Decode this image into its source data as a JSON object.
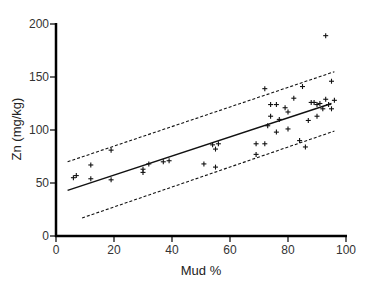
{
  "chart_data": {
    "type": "scatter",
    "title": "",
    "xlabel": "Mud %",
    "ylabel": "Zn (mg/kg)",
    "xlim": [
      0,
      100
    ],
    "ylim": [
      0,
      200
    ],
    "xticks": [
      0,
      20,
      40,
      60,
      80,
      100
    ],
    "yticks": [
      0,
      50,
      100,
      150,
      200
    ],
    "grid": false,
    "legend": null,
    "marker": "+",
    "colors": {
      "points": "#111111",
      "axis": "#000000",
      "lines": "#111111"
    },
    "points": [
      {
        "x": 6,
        "y": 55
      },
      {
        "x": 7,
        "y": 57
      },
      {
        "x": 12,
        "y": 67
      },
      {
        "x": 12,
        "y": 54
      },
      {
        "x": 19,
        "y": 81
      },
      {
        "x": 19,
        "y": 53
      },
      {
        "x": 30,
        "y": 63
      },
      {
        "x": 30,
        "y": 60
      },
      {
        "x": 32,
        "y": 68
      },
      {
        "x": 37,
        "y": 70
      },
      {
        "x": 39,
        "y": 71
      },
      {
        "x": 51,
        "y": 68
      },
      {
        "x": 54,
        "y": 86
      },
      {
        "x": 55,
        "y": 82
      },
      {
        "x": 56,
        "y": 87
      },
      {
        "x": 55,
        "y": 65
      },
      {
        "x": 69,
        "y": 87
      },
      {
        "x": 69,
        "y": 77
      },
      {
        "x": 72,
        "y": 87
      },
      {
        "x": 72,
        "y": 139
      },
      {
        "x": 73,
        "y": 104
      },
      {
        "x": 74,
        "y": 113
      },
      {
        "x": 74,
        "y": 124
      },
      {
        "x": 76,
        "y": 124
      },
      {
        "x": 76,
        "y": 98
      },
      {
        "x": 77,
        "y": 110
      },
      {
        "x": 79,
        "y": 121
      },
      {
        "x": 80,
        "y": 117
      },
      {
        "x": 80,
        "y": 101
      },
      {
        "x": 82,
        "y": 130
      },
      {
        "x": 84,
        "y": 90
      },
      {
        "x": 85,
        "y": 141
      },
      {
        "x": 86,
        "y": 84
      },
      {
        "x": 87,
        "y": 109
      },
      {
        "x": 88,
        "y": 126
      },
      {
        "x": 89,
        "y": 126
      },
      {
        "x": 90,
        "y": 124
      },
      {
        "x": 90,
        "y": 113
      },
      {
        "x": 91,
        "y": 125
      },
      {
        "x": 92,
        "y": 120
      },
      {
        "x": 93,
        "y": 189
      },
      {
        "x": 93,
        "y": 129
      },
      {
        "x": 94,
        "y": 124
      },
      {
        "x": 95,
        "y": 146
      },
      {
        "x": 95,
        "y": 120
      },
      {
        "x": 96,
        "y": 128
      }
    ],
    "lines": [
      {
        "name": "regression",
        "style": "solid",
        "x": [
          4,
          95
        ],
        "y": [
          43,
          125
        ]
      },
      {
        "name": "upper-bound",
        "style": "dashed",
        "x": [
          4,
          96
        ],
        "y": [
          70,
          155
        ]
      },
      {
        "name": "lower-bound",
        "style": "dashed",
        "x": [
          9,
          96
        ],
        "y": [
          17,
          99
        ]
      }
    ]
  }
}
